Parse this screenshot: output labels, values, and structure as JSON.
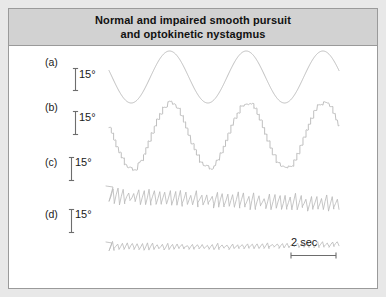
{
  "figure": {
    "title": "Normal and impaired smooth pursuit\nand optokinetic nystagmus",
    "title_line_1": "Normal and impaired smooth pursuit",
    "title_line_2": "and optokinetic nystagmus",
    "header_background": "#d2d2d2",
    "panel_background": "#ffffff",
    "border_color": "#9a9a9a",
    "trace_color": "#b8b8b8",
    "text_color": "#1a1a1a"
  },
  "rows": [
    {
      "id": "a",
      "label": "(a)",
      "scale_label": "15°"
    },
    {
      "id": "b",
      "label": "(b)",
      "scale_label": "15°"
    },
    {
      "id": "c",
      "label": "(c)",
      "scale_label": "15°"
    },
    {
      "id": "d",
      "label": "(d)",
      "scale_label": "15°"
    }
  ],
  "time_scale": {
    "label": "2 sec"
  },
  "chart_data": {
    "type": "line",
    "title": "Normal and impaired smooth pursuit and optokinetic nystagmus",
    "xlabel": "",
    "ylabel": "Eye position (degrees)",
    "grid": false,
    "legend": "none",
    "amplitude_scale_deg": 15,
    "time_scale_bar_sec": 2,
    "x_units": "seconds",
    "y_units": "degrees",
    "series": [
      {
        "name": "(a) Normal smooth pursuit",
        "trace_id": "a",
        "waveform": "sine",
        "cycles": 3,
        "amplitude_deg": 15,
        "description": "Smooth sinusoidal eye tracking with no saccadic interruption",
        "jitter_deg": 0,
        "step_count": 0,
        "drift_deg": 0
      },
      {
        "name": "(b) Impaired smooth pursuit",
        "trace_id": "b",
        "waveform": "sine-staircase",
        "cycles": 3,
        "amplitude_deg": 15,
        "description": "Sinusoidal target tracking broken into saccadic staircase steps",
        "jitter_deg": 1.2,
        "step_count": 11,
        "drift_deg": 0
      },
      {
        "name": "(c) Normal optokinetic nystagmus",
        "trace_id": "c",
        "waveform": "sawtooth",
        "beats": 44,
        "amplitude_deg": 7.5,
        "description": "Regular sawtooth nystagmus with slow phase and fast resetting phase",
        "jitter_deg": 1.0,
        "drift_deg": -3
      },
      {
        "name": "(d) Impaired optokinetic nystagmus",
        "trace_id": "d",
        "waveform": "sawtooth",
        "beats": 46,
        "amplitude_deg": 2.5,
        "description": "Markedly reduced sawtooth amplitude indicating impaired optokinetic response",
        "jitter_deg": 0.5,
        "drift_deg": -1.5
      }
    ]
  }
}
